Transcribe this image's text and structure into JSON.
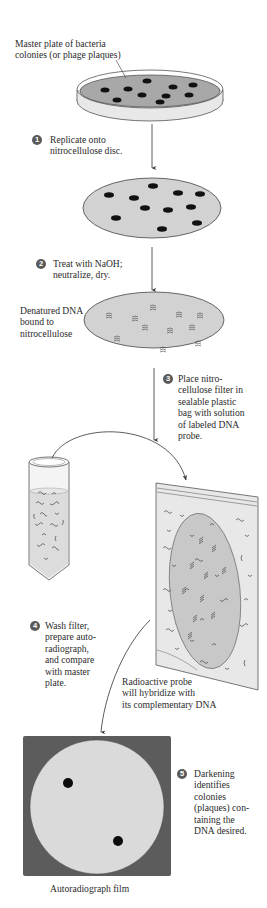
{
  "diagram": {
    "colors": {
      "plate_agar": "#a8a8a8",
      "disc_fill": "#d2d2d2",
      "colony": "#111111",
      "film_frame": "#5c5c5c",
      "film_disc": "#dadada",
      "bag_fill": "#e6e6e6",
      "filter_in_bag": "#c8c8c8",
      "step_badge": "#5a5a5a",
      "line": "#333333"
    },
    "labels": {
      "master_plate": "Master plate of bacteria\ncolonies (or phage plaques)",
      "denatured_dna": "Denatured DNA\nbound to\nnitrocellulose",
      "radioactive_probe": "Radioactive probe\nwill hybridize with\nits complementary DNA",
      "autoradiograph_film": "Autoradiograph film"
    },
    "steps": [
      {
        "number": "1",
        "text": "Replicate onto\nnitrocellulose disc."
      },
      {
        "number": "2",
        "text": "Treat with NaOH;\nneutralize, dry."
      },
      {
        "number": "3",
        "text": "Place nitro-\ncellulose filter in\nsealable plastic\nbag with solution\nof labeled DNA\nprobe."
      },
      {
        "number": "4",
        "text": "Wash filter,\nprepare auto-\nradiograph,\nand compare\nwith master\nplate."
      },
      {
        "number": "5",
        "text": "Darkening\nidentifies\ncolonies\n(plaques) con-\ntaining the\nDNA desired."
      }
    ],
    "stages": [
      {
        "name": "master-plate",
        "colony_count": 11
      },
      {
        "name": "nitrocellulose-disc",
        "colony_count": 11
      },
      {
        "name": "denatured-dna-disc",
        "spot_count": 11
      },
      {
        "name": "probe-tube"
      },
      {
        "name": "sealed-bag"
      },
      {
        "name": "autoradiograph-film",
        "dark_spot_count": 2
      }
    ]
  }
}
